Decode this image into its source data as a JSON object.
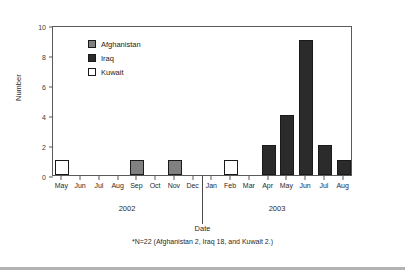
{
  "chart_data": {
    "type": "bar",
    "title": "",
    "xlabel": "Date",
    "ylabel": "Number",
    "ylim": [
      0,
      10
    ],
    "yticks": [
      0,
      2,
      4,
      6,
      8,
      10
    ],
    "grid": false,
    "legend_position": "upper-left-inside",
    "categories": [
      "May",
      "Jun",
      "Jul",
      "Aug",
      "Sep",
      "Oct",
      "Nov",
      "Dec",
      "Jan",
      "Feb",
      "Mar",
      "Apr",
      "May",
      "Jun",
      "Jul",
      "Aug"
    ],
    "group_labels": [
      "2002",
      "2003"
    ],
    "series": [
      {
        "name": "Afghanistan",
        "color": "#808080",
        "values": [
          0,
          0,
          0,
          0,
          1,
          0,
          1,
          0,
          0,
          0,
          0,
          0,
          0,
          0,
          0,
          0
        ]
      },
      {
        "name": "Iraq",
        "color": "#2b2b2b",
        "values": [
          0,
          0,
          0,
          0,
          0,
          0,
          0,
          0,
          0,
          0,
          0,
          2,
          4,
          9,
          2,
          1
        ]
      },
      {
        "name": "Kuwait",
        "color": "#ffffff",
        "values": [
          1,
          0,
          0,
          0,
          0,
          0,
          0,
          0,
          0,
          1,
          0,
          0,
          0,
          0,
          0,
          0
        ]
      }
    ],
    "annotations": [
      "*N=22 (Afghanistan 2, Iraq 18, and Kuwait 2.)"
    ]
  },
  "legend": {
    "items": [
      {
        "label": "Afghanistan",
        "color": "#808080"
      },
      {
        "label": "Iraq",
        "color": "#2b2b2b"
      },
      {
        "label": "Kuwait",
        "color": "#ffffff"
      }
    ]
  },
  "footnote": "*N=22 (Afghanistan 2, Iraq 18, and Kuwait 2.)",
  "axes": {
    "y_title": "Number",
    "x_title": "Date"
  }
}
